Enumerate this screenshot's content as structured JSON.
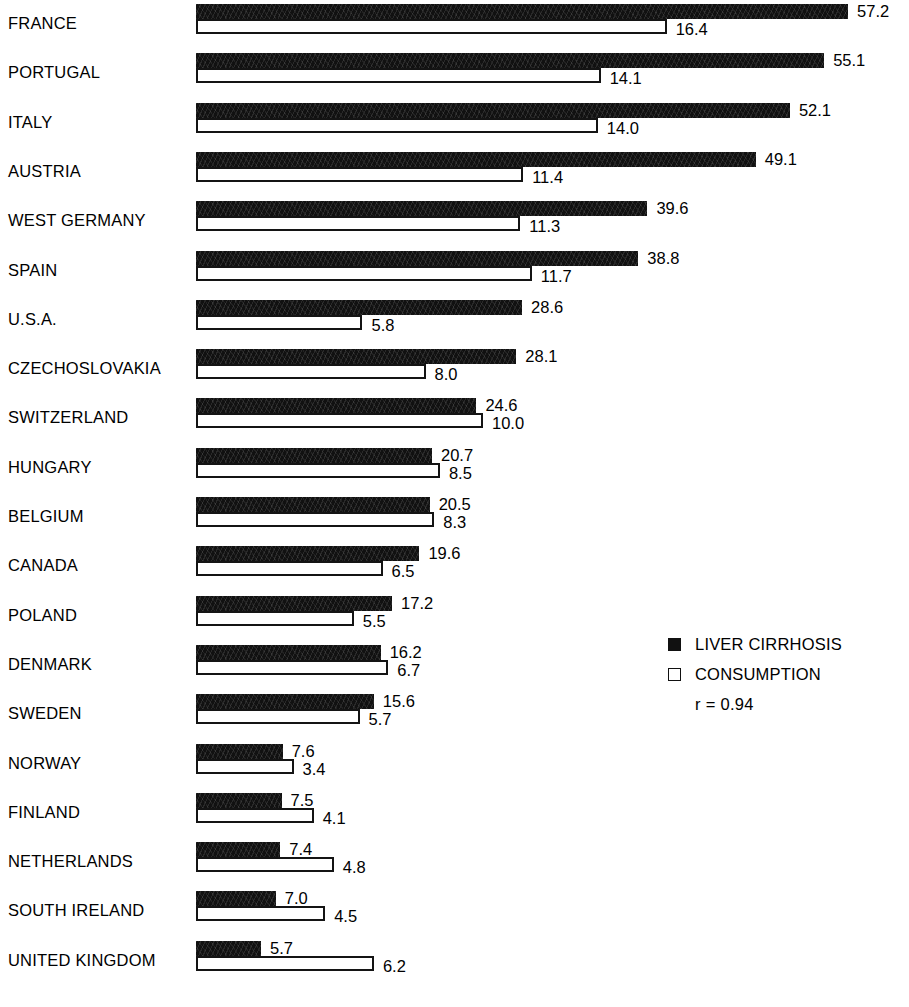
{
  "chart_data": {
    "type": "bar",
    "orientation": "horizontal",
    "title": "",
    "subtitle": "",
    "xlabel": "",
    "ylabel": "",
    "grid": false,
    "legend_position": "right",
    "categories": [
      "FRANCE",
      "PORTUGAL",
      "ITALY",
      "AUSTRIA",
      "WEST GERMANY",
      "SPAIN",
      "U.S.A.",
      "CZECHOSLOVAKIA",
      "SWITZERLAND",
      "HUNGARY",
      "BELGIUM",
      "CANADA",
      "POLAND",
      "DENMARK",
      "SWEDEN",
      "NORWAY",
      "FINLAND",
      "NETHERLANDS",
      "SOUTH IRELAND",
      "UNITED KINGDOM"
    ],
    "series": [
      {
        "name": "LIVER CIRRHOSIS",
        "style": "filled-black",
        "values": [
          57.2,
          55.1,
          52.1,
          49.1,
          39.6,
          38.8,
          28.6,
          28.1,
          24.6,
          20.7,
          20.5,
          19.6,
          17.2,
          16.2,
          15.6,
          7.6,
          7.5,
          7.4,
          7.0,
          5.7
        ],
        "labels": [
          "57.2",
          "55.1",
          "52.1",
          "49.1",
          "39.6",
          "38.8",
          "28.6",
          "28.1",
          "24.6",
          "20.7",
          "20.5",
          "19.6",
          "17.2",
          "16.2",
          "15.6",
          "7.6",
          "7.5",
          "7.4",
          "7.0",
          "5.7"
        ]
      },
      {
        "name": "CONSUMPTION",
        "style": "hollow-white",
        "values": [
          16.4,
          14.1,
          14.0,
          11.4,
          11.3,
          11.7,
          5.8,
          8.0,
          10.0,
          8.5,
          8.3,
          6.5,
          5.5,
          6.7,
          5.7,
          3.4,
          4.1,
          4.8,
          4.5,
          6.2
        ],
        "labels": [
          "16.4",
          "14.1",
          "14.0",
          "11.4",
          "11.3",
          "11.7",
          "5.8",
          "8.0",
          "10.0",
          "8.5",
          "8.3",
          "6.5",
          "5.5",
          "6.7",
          "5.7",
          "3.4",
          "4.1",
          "4.8",
          "4.5",
          "6.2"
        ]
      }
    ],
    "annotations": [
      "r = 0.94"
    ],
    "scale_px_per_unit": {
      "LIVER CIRRHOSIS": 11.4,
      "CONSUMPTION": 28.7
    }
  },
  "legend": {
    "items": [
      {
        "label": "LIVER CIRRHOSIS",
        "swatch": "filled-square-icon"
      },
      {
        "label": "CONSUMPTION",
        "swatch": "hollow-square-icon"
      }
    ],
    "correlation": "r = 0.94"
  },
  "colors": {
    "bar_fill": "#111111",
    "bar_outline": "#141414",
    "background": "#ffffff",
    "text": "#000000"
  }
}
